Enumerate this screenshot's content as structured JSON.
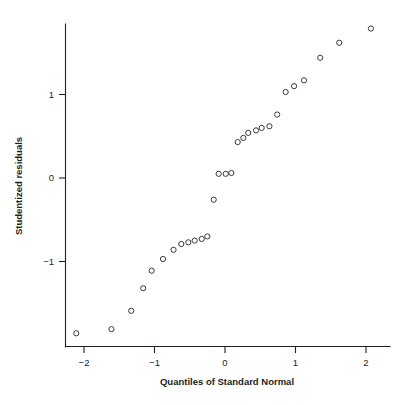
{
  "chart_data": {
    "type": "scatter",
    "title": "",
    "subtitle": "",
    "xlabel": "Quantiles of Standard Normal",
    "ylabel": "Studentized residuals",
    "xlim": [
      -2.27,
      2.34
    ],
    "ylim": [
      -1.99,
      1.93
    ],
    "xticks": [
      -2,
      -1,
      0,
      1,
      2
    ],
    "xticklabels": [
      "−2",
      "−1",
      "0",
      "1",
      "2"
    ],
    "yticks": [
      1,
      0,
      -1
    ],
    "yticklabels": [
      "1",
      "0",
      "−1"
    ],
    "grid": false,
    "legend": false,
    "marker": "open-circle",
    "marker_color": "#3a3a3c",
    "marker_radius": 2.6,
    "n_points": 28,
    "x": [
      -2.11,
      -1.61,
      -1.33,
      -1.16,
      -1.04,
      -0.88,
      -0.73,
      -0.62,
      -0.52,
      -0.43,
      -0.33,
      -0.25,
      -0.16,
      -0.09,
      0.01,
      0.09,
      0.18,
      0.26,
      0.33,
      0.44,
      0.52,
      0.63,
      0.74,
      0.86,
      0.98,
      1.12,
      1.35,
      1.62,
      2.07
    ],
    "y": [
      -1.86,
      -1.81,
      -1.59,
      -1.32,
      -1.11,
      -0.97,
      -0.86,
      -0.79,
      -0.77,
      -0.75,
      -0.73,
      -0.7,
      -0.26,
      0.05,
      0.05,
      0.06,
      0.43,
      0.48,
      0.54,
      0.57,
      0.6,
      0.62,
      0.76,
      1.03,
      1.1,
      1.17,
      1.44,
      1.62,
      1.79
    ],
    "points": [
      {
        "x": -2.11,
        "y": -1.86
      },
      {
        "x": -1.61,
        "y": -1.81
      },
      {
        "x": -1.33,
        "y": -1.59
      },
      {
        "x": -1.16,
        "y": -1.32
      },
      {
        "x": -1.04,
        "y": -1.11
      },
      {
        "x": -0.88,
        "y": -0.97
      },
      {
        "x": -0.73,
        "y": -0.86
      },
      {
        "x": -0.62,
        "y": -0.79
      },
      {
        "x": -0.52,
        "y": -0.77
      },
      {
        "x": -0.43,
        "y": -0.75
      },
      {
        "x": -0.33,
        "y": -0.73
      },
      {
        "x": -0.25,
        "y": -0.7
      },
      {
        "x": -0.16,
        "y": -0.26
      },
      {
        "x": -0.09,
        "y": 0.05
      },
      {
        "x": 0.01,
        "y": 0.05
      },
      {
        "x": 0.09,
        "y": 0.06
      },
      {
        "x": 0.18,
        "y": 0.43
      },
      {
        "x": 0.26,
        "y": 0.48
      },
      {
        "x": 0.33,
        "y": 0.54
      },
      {
        "x": 0.44,
        "y": 0.57
      },
      {
        "x": 0.52,
        "y": 0.6
      },
      {
        "x": 0.63,
        "y": 0.62
      },
      {
        "x": 0.74,
        "y": 0.76
      },
      {
        "x": 0.86,
        "y": 1.03
      },
      {
        "x": 0.98,
        "y": 1.1
      },
      {
        "x": 1.12,
        "y": 1.17
      },
      {
        "x": 1.35,
        "y": 1.44
      },
      {
        "x": 1.62,
        "y": 1.62
      },
      {
        "x": 2.07,
        "y": 1.79
      }
    ]
  }
}
